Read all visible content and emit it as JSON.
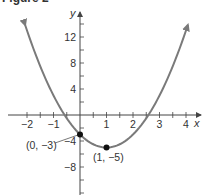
{
  "figure": {
    "label": "Figure 2"
  },
  "chart_data": {
    "type": "line",
    "title": "Figure 2",
    "function": "f(x) = 2x^2 - 4x - 3",
    "xlabel": "x",
    "ylabel": "y",
    "xlim": [
      -2.7,
      4.5
    ],
    "ylim": [
      -12,
      16
    ],
    "x_ticks": [
      -2,
      -1,
      1,
      2,
      3,
      4
    ],
    "x_tick_labels": [
      "−2",
      "−1",
      "1",
      "2",
      "3",
      "4"
    ],
    "y_ticks": [
      12,
      8,
      4,
      -4,
      -8
    ],
    "y_tick_labels": [
      "12",
      "8",
      "4",
      "−4",
      "−8"
    ],
    "grid": false,
    "legend": null,
    "series": [
      {
        "name": "parabola",
        "color": "#7a7a7a",
        "x": [
          -2.07,
          -1.5,
          -1,
          -0.5,
          0,
          0.5,
          1,
          1.5,
          2,
          2.5,
          3,
          3.5,
          4.07
        ],
        "y": [
          13.8,
          7.5,
          3,
          -0.5,
          -3,
          -4.5,
          -5,
          -4.5,
          -3,
          -0.5,
          3,
          7.5,
          13.8
        ]
      }
    ],
    "annotations": [
      {
        "point": [
          0,
          -3
        ],
        "label": "(0, −3)"
      },
      {
        "point": [
          1,
          -5
        ],
        "label": "(1, −5)"
      }
    ]
  },
  "colors": {
    "curve": "#7a7a7a",
    "axis": "#444444",
    "point": "#111111",
    "text": "#333333"
  }
}
